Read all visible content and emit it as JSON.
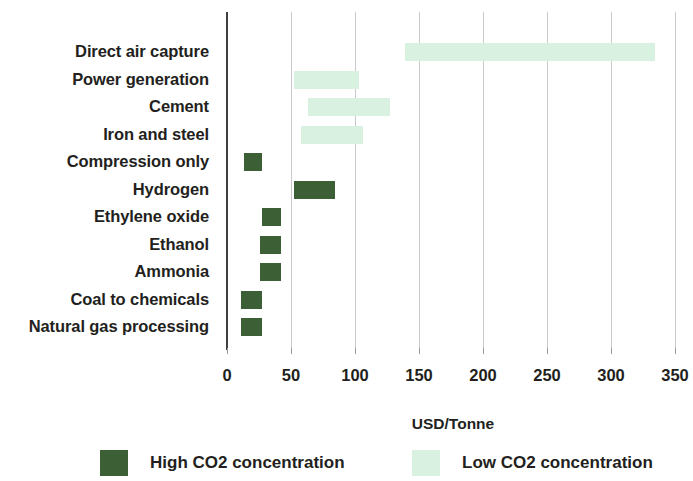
{
  "chart_data": {
    "type": "bar",
    "orientation": "horizontal",
    "subtype": "floating-range-bar",
    "title": "",
    "subtitle": "",
    "xlabel": "USD/Tonne",
    "ylabel": "",
    "xlim": [
      0,
      353
    ],
    "xticks": [
      0,
      50,
      100,
      150,
      200,
      250,
      300,
      350
    ],
    "xtick_labels": [
      "0",
      "50",
      "100",
      "150",
      "200",
      "250",
      "300",
      "350"
    ],
    "grid": "vertical",
    "legend_position": "bottom",
    "categories": [
      "Direct air capture",
      "Power generation",
      "Cement",
      "Iron and steel",
      "Compression only",
      "Hydrogen",
      "Ethylene oxide",
      "Ethanol",
      "Ammonia",
      "Coal to chemicals",
      "Natural gas processing"
    ],
    "series": [
      {
        "name": "High CO2 concentration",
        "color": "#3d5f35",
        "ranges": [
          null,
          null,
          null,
          null,
          [
            13,
            27
          ],
          [
            52,
            84
          ],
          [
            27,
            42
          ],
          [
            26,
            42
          ],
          [
            26,
            42
          ],
          [
            11,
            27
          ],
          [
            11,
            27
          ]
        ]
      },
      {
        "name": "Low CO2 concentration",
        "color": "#d9f1e1",
        "ranges": [
          [
            139,
            334
          ],
          [
            52,
            103
          ],
          [
            63,
            127
          ],
          [
            58,
            106
          ],
          null,
          null,
          null,
          null,
          null,
          null,
          null
        ]
      }
    ],
    "bars": [
      {
        "category": "Direct air capture",
        "series": "Low CO2 concentration",
        "low": 139,
        "high": 334
      },
      {
        "category": "Power generation",
        "series": "Low CO2 concentration",
        "low": 52,
        "high": 103
      },
      {
        "category": "Cement",
        "series": "Low CO2 concentration",
        "low": 63,
        "high": 127
      },
      {
        "category": "Iron and steel",
        "series": "Low CO2 concentration",
        "low": 58,
        "high": 106
      },
      {
        "category": "Compression only",
        "series": "High CO2 concentration",
        "low": 13,
        "high": 27
      },
      {
        "category": "Hydrogen",
        "series": "High CO2 concentration",
        "low": 52,
        "high": 84
      },
      {
        "category": "Ethylene oxide",
        "series": "High CO2 concentration",
        "low": 27,
        "high": 42
      },
      {
        "category": "Ethanol",
        "series": "High CO2 concentration",
        "low": 26,
        "high": 42
      },
      {
        "category": "Ammonia",
        "series": "High CO2 concentration",
        "low": 26,
        "high": 42
      },
      {
        "category": "Coal to chemicals",
        "series": "High CO2 concentration",
        "low": 11,
        "high": 27
      },
      {
        "category": "Natural gas processing",
        "series": "High CO2 concentration",
        "low": 11,
        "high": 27
      }
    ]
  },
  "legend": {
    "items": [
      {
        "label": "High CO2 concentration",
        "color": "#3d5f35",
        "swatch": "legend-swatch-high"
      },
      {
        "label": "Low CO2 concentration",
        "color": "#d9f1e1",
        "swatch": "legend-swatch-low"
      }
    ]
  },
  "axis": {
    "x_title": "USD/Tonne"
  },
  "colors": {
    "high_concentration": "#3d5f35",
    "low_concentration": "#d9f1e1",
    "axis": "#3f3f3f",
    "grid": "#c9c9c9",
    "text": "#231f20",
    "background": "#ffffff"
  }
}
